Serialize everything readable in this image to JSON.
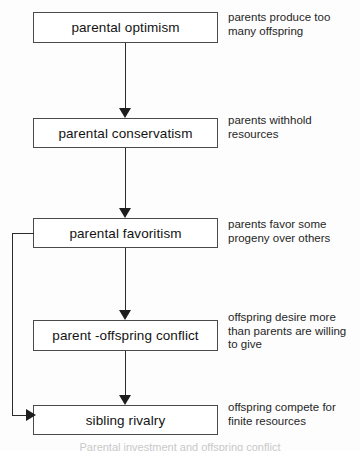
{
  "diagram": {
    "stroke_color": "#2b2b2b",
    "box_border_color": "#4a4a4a",
    "background_color": "#fdfdfd",
    "nodes": [
      {
        "id": "parental-optimism",
        "label": "parental optimism"
      },
      {
        "id": "parental-conservatism",
        "label": "parental conservatism"
      },
      {
        "id": "parental-favoritism",
        "label": "parental favoritism"
      },
      {
        "id": "parent-offspring-conflict",
        "label": "parent -offspring conflict"
      },
      {
        "id": "sibling-rivalry",
        "label": "sibling rivalry"
      }
    ],
    "notes": [
      {
        "id": "note-optimism",
        "text": "parents produce too\nmany offspring"
      },
      {
        "id": "note-conservatism",
        "text": "parents withhold\nresources"
      },
      {
        "id": "note-favoritism",
        "text": "parents favor some\nprogeny over others"
      },
      {
        "id": "note-conflict",
        "text": "offspring desire more\nthan parents are willing\nto give"
      },
      {
        "id": "note-rivalry",
        "text": "offspring compete for\nfinite resources"
      }
    ],
    "edges": [
      {
        "id": "edge-optimism-conservatism",
        "from": "parental optimism",
        "to": "parental conservatism",
        "kind": "down-arrow"
      },
      {
        "id": "edge-conservatism-favoritism",
        "from": "parental conservatism",
        "to": "parental favoritism",
        "kind": "down-arrow"
      },
      {
        "id": "edge-favoritism-conflict",
        "from": "parental favoritism",
        "to": "parent -offspring conflict",
        "kind": "down-arrow"
      },
      {
        "id": "edge-conflict-rivalry",
        "from": "parent -offspring conflict",
        "to": "sibling rivalry",
        "kind": "down-arrow"
      },
      {
        "id": "edge-favoritism-rivalry-loop",
        "from": "parental favoritism",
        "to": "sibling rivalry",
        "kind": "left-bypass-arrow"
      }
    ],
    "caption": "Parental investment and offspring conflict"
  }
}
